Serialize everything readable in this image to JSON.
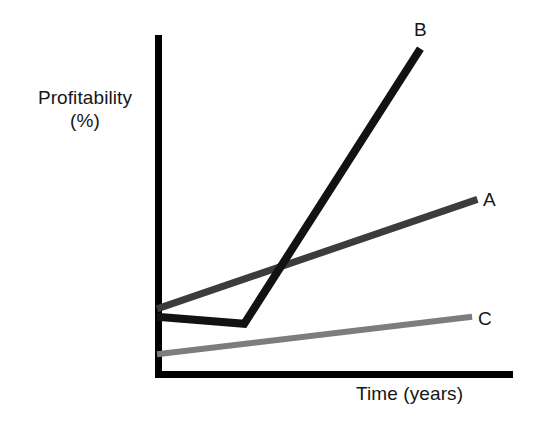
{
  "figure": {
    "background_color": "#ffffff",
    "axis_color": "#000000"
  },
  "axes": {
    "y_title_line1": "Profitability",
    "y_title_line2": "(%)",
    "x_title": "Time (years)"
  },
  "series_labels": {
    "a": "A",
    "b": "B",
    "c": "C"
  },
  "chart_data": {
    "type": "line",
    "title": "",
    "subtitle": "",
    "xlabel": "Time (years)",
    "ylabel": "Profitability (%)",
    "xlim": [
      0,
      10
    ],
    "ylim": [
      0,
      10
    ],
    "grid": false,
    "legend": "inline-end-labels",
    "axis_ticks": false,
    "axis_tick_labels": false,
    "annotations": [
      {
        "text": "B",
        "x": 7.35,
        "y": 9.6
      },
      {
        "text": "A",
        "x": 9.2,
        "y": 5.15
      },
      {
        "text": "C",
        "x": 9.05,
        "y": 1.7
      }
    ],
    "series": [
      {
        "name": "A",
        "color": "#3c3c3c",
        "line_width": 6,
        "x": [
          0,
          9.0
        ],
        "y": [
          1.92,
          5.15
        ]
      },
      {
        "name": "B",
        "color": "#121212",
        "line_width": 7,
        "x": [
          0,
          2.45,
          7.4
        ],
        "y": [
          1.69,
          1.48,
          9.6
        ]
      },
      {
        "name": "C",
        "color": "#7d7d7d",
        "line_width": 5,
        "x": [
          0,
          8.85
        ],
        "y": [
          0.58,
          1.69
        ]
      }
    ]
  }
}
